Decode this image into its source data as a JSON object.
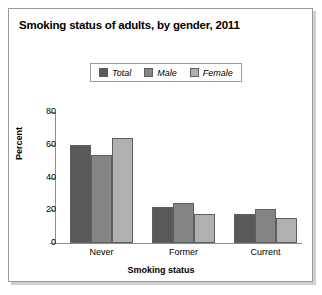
{
  "figure": {
    "title": "Smoking status of adults, by gender, 2011"
  },
  "chart_data": {
    "type": "bar",
    "title": "Smoking status of adults, by gender, 2011",
    "xlabel": "Smoking status",
    "ylabel": "Percent",
    "categories": [
      "Never",
      "Former",
      "Current"
    ],
    "series": [
      {
        "name": "Total",
        "color": "#595959",
        "values": [
          60,
          22,
          18
        ]
      },
      {
        "name": "Male",
        "color": "#848484",
        "values": [
          54,
          24.5,
          21
        ]
      },
      {
        "name": "Female",
        "color": "#b0b0b0",
        "values": [
          64,
          18,
          15.5
        ]
      }
    ],
    "ylim": [
      0,
      80
    ],
    "yticks": [
      0,
      20,
      40,
      60,
      80
    ],
    "ytick_labels": [
      "0",
      "20",
      "40",
      "60",
      "80"
    ],
    "grid": false,
    "legend_position": "top-center"
  }
}
